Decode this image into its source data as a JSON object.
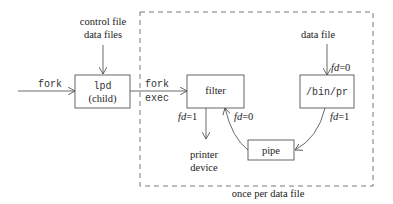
{
  "diagram": {
    "inputs": {
      "control_label_1": "control file",
      "control_label_2": "data files",
      "fork_in": "fork",
      "data_file": "data file"
    },
    "boxes": {
      "lpd_line1": "lpd",
      "lpd_line2": "(child)",
      "filter": "filter",
      "binpr": "/bin/pr",
      "pipe": "pipe"
    },
    "edges": {
      "fork": "fork",
      "exec": "exec",
      "fd_pr_in_pre": "fd",
      "fd_pr_in_val": "=0",
      "fd_pr_out_pre": "fd",
      "fd_pr_out_val": "=1",
      "fd_filter_out_pre": "fd",
      "fd_filter_out_val": "=1",
      "fd_filter_in_pre": "fd",
      "fd_filter_in_val": "=0"
    },
    "outputs": {
      "printer_1": "printer",
      "printer_2": "device"
    },
    "group_label": "once per data file"
  }
}
